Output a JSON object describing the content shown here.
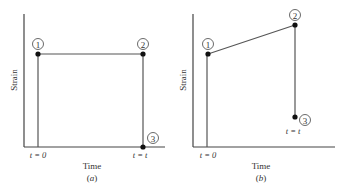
{
  "panels": [
    {
      "id": "a",
      "caption": "(a)",
      "caption_letter": "a",
      "xlabel": "Time",
      "ylabel": "Strain",
      "tick_start": "t = 0",
      "tick_end": "t = t",
      "points": [
        {
          "label": "1",
          "desc": "initial strain at t=0"
        },
        {
          "label": "2",
          "desc": "strain held constant until t"
        },
        {
          "label": "3",
          "desc": "strain removed at t=t"
        }
      ]
    },
    {
      "id": "b",
      "caption": "(b)",
      "caption_letter": "b",
      "xlabel": "Time",
      "ylabel": "Strain",
      "tick_start": "t = 0",
      "tick_end": "t = t",
      "points": [
        {
          "label": "1",
          "desc": "initial elastic strain at t=0"
        },
        {
          "label": "2",
          "desc": "strain increased (creep) until t"
        },
        {
          "label": "3",
          "desc": "partial recovery at t=t"
        }
      ]
    }
  ],
  "colors": {
    "axis": "#333333",
    "line": "#555555",
    "point": "#111111"
  }
}
